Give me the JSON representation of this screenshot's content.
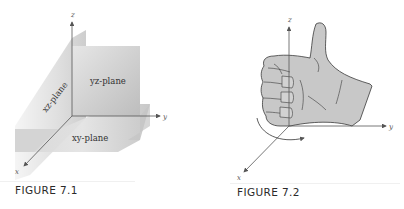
{
  "figures": [
    {
      "id": "fig1",
      "caption": "FIGURE 7.1",
      "axes": {
        "x": "x",
        "y": "y",
        "z": "z"
      },
      "planes": {
        "yz": "yz-plane",
        "xz": "xz-plane",
        "xy": "xy-plane"
      }
    },
    {
      "id": "fig2",
      "caption": "FIGURE 7.2",
      "axes": {
        "x": "x",
        "y": "y",
        "z": "z"
      },
      "illustration": "right-hand-rule-thumbs-up"
    }
  ],
  "colors": {
    "plane_gray_dark": "#b8b8b8",
    "plane_gray_light": "#ececec",
    "hand_fill": "#c8c8c8",
    "axis": "#555555",
    "caption": "#2a2a2a"
  }
}
